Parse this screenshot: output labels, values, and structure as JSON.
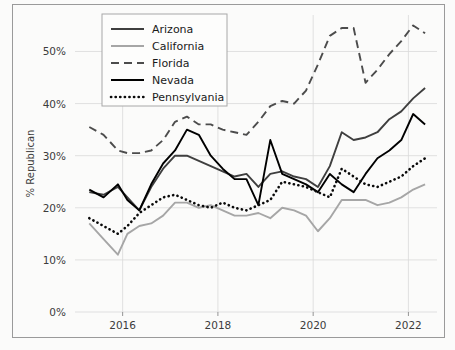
{
  "chart_data": {
    "type": "line",
    "title": "",
    "xlabel": "",
    "ylabel": "% Republican",
    "xlim": [
      2015.0,
      2022.6
    ],
    "ylim": [
      0,
      57
    ],
    "grid": true,
    "legend_position": "top-left-inside",
    "xticks": [
      2016,
      2018,
      2020,
      2022
    ],
    "xticklabels": [
      "2016",
      "2018",
      "2020",
      "2022"
    ],
    "yticks": [
      0,
      10,
      20,
      30,
      40,
      50
    ],
    "yticklabels": [
      "0%",
      "10%",
      "20%",
      "30%",
      "40%",
      "50%"
    ],
    "x": [
      2015.3,
      2015.6,
      2015.9,
      2016.1,
      2016.35,
      2016.6,
      2016.85,
      2017.1,
      2017.35,
      2017.6,
      2017.85,
      2018.1,
      2018.35,
      2018.6,
      2018.85,
      2019.1,
      2019.35,
      2019.6,
      2019.85,
      2020.1,
      2020.35,
      2020.6,
      2020.85,
      2021.1,
      2021.35,
      2021.6,
      2021.85,
      2022.1,
      2022.35
    ],
    "series": [
      {
        "name": "Arizona",
        "color": "#3f3f3f",
        "style": "solid",
        "values": [
          23.0,
          22.5,
          24.0,
          22.0,
          19.5,
          24.0,
          27.5,
          30.0,
          30.0,
          29.0,
          28.0,
          27.0,
          26.0,
          26.5,
          24.0,
          26.5,
          27.0,
          26.0,
          25.5,
          24.0,
          28.0,
          34.5,
          33.0,
          33.5,
          34.5,
          37.0,
          38.5,
          41.0,
          43.0
        ]
      },
      {
        "name": "California",
        "color": "#a6a6a6",
        "style": "solid",
        "values": [
          17.0,
          14.0,
          11.0,
          15.0,
          16.5,
          17.0,
          18.5,
          21.0,
          21.0,
          20.0,
          20.5,
          19.5,
          18.5,
          18.5,
          19.0,
          18.0,
          20.0,
          19.5,
          18.5,
          15.5,
          18.0,
          21.5,
          21.5,
          21.5,
          20.5,
          21.0,
          22.0,
          23.5,
          24.5
        ]
      },
      {
        "name": "Florida",
        "color": "#4c4c4c",
        "style": "dashed",
        "values": [
          35.5,
          34.0,
          31.0,
          30.5,
          30.5,
          31.0,
          33.0,
          36.5,
          37.5,
          36.0,
          36.0,
          35.0,
          34.5,
          34.0,
          36.5,
          39.5,
          40.5,
          40.0,
          42.5,
          47.5,
          53.0,
          54.5,
          54.5,
          44.0,
          46.5,
          49.5,
          52.0,
          55.0,
          53.5
        ]
      },
      {
        "name": "Nevada",
        "color": "#000000",
        "style": "solid",
        "values": [
          23.5,
          22.0,
          24.5,
          21.5,
          19.5,
          24.5,
          28.5,
          31.0,
          35.0,
          34.0,
          30.0,
          27.5,
          25.5,
          25.5,
          20.5,
          33.0,
          26.5,
          25.5,
          24.5,
          23.0,
          26.5,
          24.5,
          23.0,
          26.5,
          29.5,
          31.0,
          33.0,
          38.0,
          36.0
        ]
      },
      {
        "name": "Pennsylvania",
        "color": "#0a0a0a",
        "style": "dotted",
        "values": [
          18.0,
          16.5,
          15.0,
          16.5,
          19.0,
          20.5,
          22.0,
          22.5,
          21.5,
          20.5,
          20.0,
          21.0,
          20.0,
          19.5,
          20.5,
          21.5,
          25.0,
          24.5,
          24.0,
          23.0,
          22.0,
          27.5,
          26.0,
          24.5,
          24.0,
          25.0,
          26.0,
          28.0,
          29.5
        ]
      }
    ]
  },
  "legend": {
    "entries": [
      {
        "label": "Arizona"
      },
      {
        "label": "California"
      },
      {
        "label": "Florida"
      },
      {
        "label": "Nevada"
      },
      {
        "label": "Pennsylvania"
      }
    ]
  }
}
